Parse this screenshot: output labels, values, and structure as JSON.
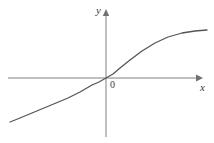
{
  "figure": {
    "background_color": "#ffffff",
    "width": 214,
    "height": 143
  },
  "labels": {
    "y_axis": "y",
    "x_axis": "x",
    "origin": "0"
  },
  "chart_data": {
    "type": "line",
    "title": "",
    "subtitle": "",
    "xlabel": "x",
    "ylabel": "y",
    "origin_label": "0",
    "grid": false,
    "legend": null,
    "axes": {
      "x_axis_pixel_y": 78,
      "y_axis_pixel_x": 106,
      "x_axis_start_px": 8,
      "x_axis_end_px": 200,
      "y_axis_top_px": 12,
      "y_axis_bottom_px": 137,
      "arrows": [
        "x-right",
        "y-up"
      ],
      "tick_labels_x": [],
      "tick_labels_y": [],
      "color": "#808080"
    },
    "series": [
      {
        "name": "curve",
        "color": "#555555",
        "line_width": 1.3,
        "description": "monotonically increasing odd-symmetric sigmoid curve through the origin",
        "points_px": [
          [
            10,
            122
          ],
          [
            20,
            118
          ],
          [
            32,
            113
          ],
          [
            44,
            108
          ],
          [
            56,
            103
          ],
          [
            68,
            98
          ],
          [
            80,
            92
          ],
          [
            92,
            85
          ],
          [
            99,
            82
          ],
          [
            106,
            78
          ],
          [
            113,
            74
          ],
          [
            120,
            68
          ],
          [
            130,
            60
          ],
          [
            142,
            51
          ],
          [
            155,
            43
          ],
          [
            168,
            37
          ],
          [
            182,
            33
          ],
          [
            195,
            31
          ],
          [
            207,
            30
          ]
        ],
        "x": [
          -4.8,
          -4.3,
          -3.7,
          -3.1,
          -2.5,
          -1.9,
          -1.3,
          -0.7,
          -0.35,
          0,
          0.35,
          0.7,
          1.2,
          1.8,
          2.45,
          3.1,
          3.8,
          4.45,
          5.05
        ],
        "y": [
          -1.1,
          -1.0,
          -0.875,
          -0.75,
          -0.625,
          -0.5,
          -0.35,
          -0.175,
          -0.1,
          0,
          0.1,
          0.25,
          0.45,
          0.675,
          0.875,
          1.025,
          1.125,
          1.175,
          1.2
        ]
      }
    ]
  }
}
